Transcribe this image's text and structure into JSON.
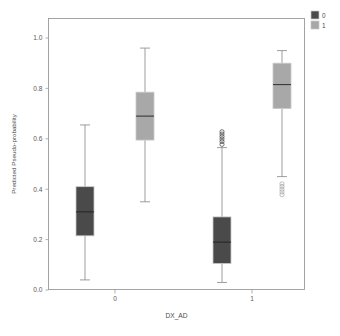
{
  "chart_data": {
    "type": "box",
    "title": "",
    "xlabel": "DX_AD",
    "ylabel": "Predicted Pseudo-probability",
    "ylim": [
      0.0,
      1.05
    ],
    "ytick_labels": [
      "0.0",
      "0.2",
      "0.4",
      "0.6",
      "0.8",
      "1.0"
    ],
    "ytick_values": [
      0.0,
      0.2,
      0.4,
      0.6,
      0.8,
      1.0
    ],
    "xtick_labels": [
      "0",
      "1"
    ],
    "grid": false,
    "legend": {
      "position": "top-right",
      "entries": [
        {
          "label": "0",
          "color": "#4a4a4a"
        },
        {
          "label": "1",
          "color": "#a8a8a8"
        }
      ]
    },
    "groups": [
      {
        "category": "0",
        "boxes": [
          {
            "series": "0",
            "color": "#4a4a4a",
            "whisker_low": 0.04,
            "q1": 0.215,
            "median": 0.31,
            "q3": 0.41,
            "whisker_high": 0.655,
            "outliers": []
          },
          {
            "series": "1",
            "color": "#a8a8a8",
            "whisker_low": 0.35,
            "q1": 0.595,
            "median": 0.69,
            "q3": 0.785,
            "whisker_high": 0.96,
            "outliers": []
          }
        ]
      },
      {
        "category": "1",
        "boxes": [
          {
            "series": "0",
            "color": "#4a4a4a",
            "whisker_low": 0.03,
            "q1": 0.105,
            "median": 0.19,
            "q3": 0.29,
            "whisker_high": 0.565,
            "outliers": [
              0.578,
              0.589,
              0.599,
              0.609,
              0.619,
              0.628
            ]
          },
          {
            "series": "1",
            "color": "#a8a8a8",
            "whisker_low": 0.45,
            "q1": 0.72,
            "median": 0.815,
            "q3": 0.9,
            "whisker_high": 0.95,
            "outliers": [
              0.378,
              0.389,
              0.4,
              0.411,
              0.421
            ]
          }
        ]
      }
    ]
  }
}
